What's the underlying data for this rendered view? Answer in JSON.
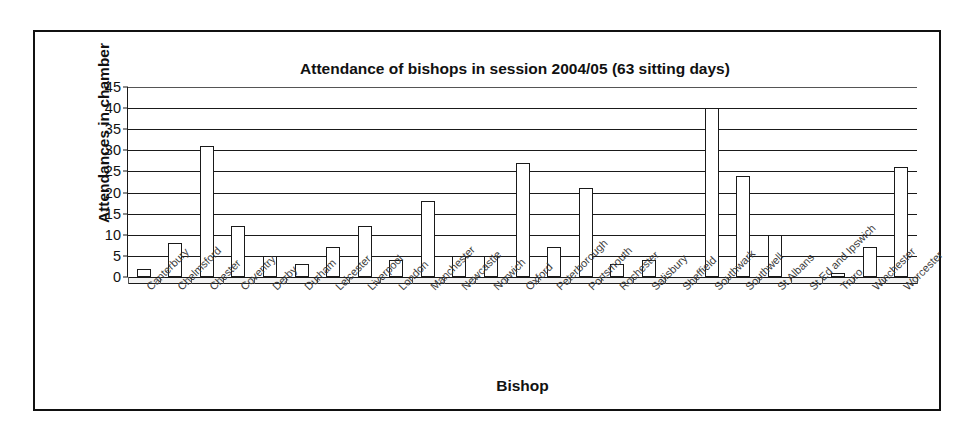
{
  "chart_data": {
    "type": "bar",
    "title": "Attendance of bishops in session 2004/05 (63 sitting days)",
    "xlabel": "Bishop",
    "ylabel": "Attendances in chamber",
    "ylim": [
      0,
      45
    ],
    "ytick_step": 5,
    "yticks": [
      "0",
      "5",
      "10",
      "15",
      "20",
      "25",
      "30",
      "35",
      "40",
      "45"
    ],
    "grid": true,
    "legend": "none",
    "bar_style": {
      "fill": "#ffffff",
      "border": "#1a1a1a"
    },
    "categories": [
      "Canterbury",
      "Chelmsford",
      "Chester",
      "Coventry",
      "Derby",
      "Durham",
      "Leicester",
      "Liverpool",
      "London",
      "Manchester",
      "Newcastle",
      "Norwich",
      "Oxford",
      "Peterborough",
      "Portsmouth",
      "Rochester",
      "Salisbury",
      "Sheffield",
      "Southwark",
      "Southwell",
      "St Albans",
      "St Ed and Ipswich",
      "Truro",
      "Winchester",
      "Worcester"
    ],
    "values": [
      2,
      8,
      31,
      12,
      5,
      3,
      7,
      12,
      4,
      18,
      5,
      5,
      27,
      7,
      21,
      3,
      4,
      0,
      40,
      24,
      10,
      0,
      1,
      7,
      26
    ]
  }
}
